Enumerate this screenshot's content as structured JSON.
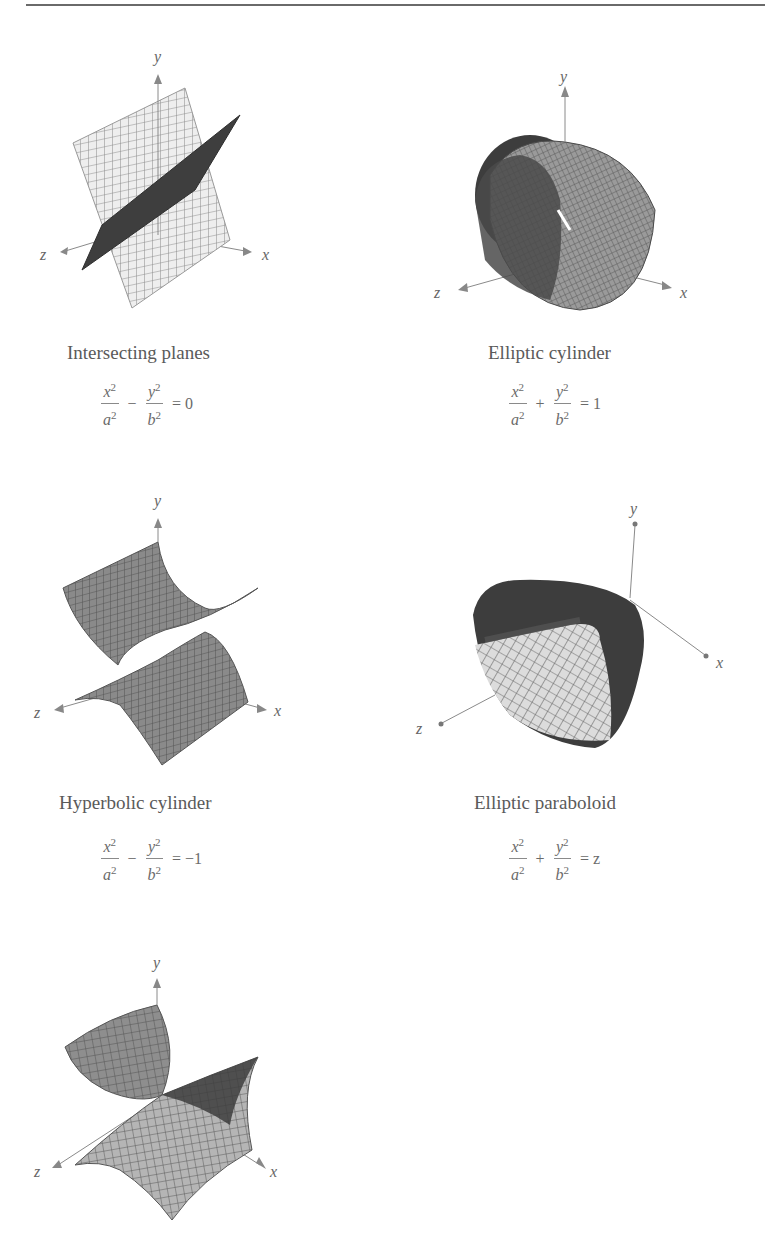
{
  "page": {
    "figures": [
      {
        "id": "intersecting-planes",
        "caption": "Intersecting planes",
        "equation": {
          "term1_num": "x",
          "term1_den": "a",
          "operator": "−",
          "term2_num": "y",
          "term2_den": "b",
          "exp": "2",
          "rhs": "= 0"
        },
        "axes": {
          "x": "x",
          "y": "y",
          "z": "z"
        }
      },
      {
        "id": "elliptic-cylinder",
        "caption": "Elliptic cylinder",
        "equation": {
          "term1_num": "x",
          "term1_den": "a",
          "operator": "+",
          "term2_num": "y",
          "term2_den": "b",
          "exp": "2",
          "rhs": "= 1"
        },
        "axes": {
          "x": "x",
          "y": "y",
          "z": "z"
        }
      },
      {
        "id": "hyperbolic-cylinder",
        "caption": "Hyperbolic cylinder",
        "equation": {
          "term1_num": "x",
          "term1_den": "a",
          "operator": "−",
          "term2_num": "y",
          "term2_den": "b",
          "exp": "2",
          "rhs": "= −1"
        },
        "axes": {
          "x": "x",
          "y": "y",
          "z": "z"
        }
      },
      {
        "id": "elliptic-paraboloid",
        "caption": "Elliptic paraboloid",
        "equation": {
          "term1_num": "x",
          "term1_den": "a",
          "operator": "+",
          "term2_num": "y",
          "term2_den": "b",
          "exp": "2",
          "rhs": "= z"
        },
        "axes": {
          "x": "x",
          "y": "y",
          "z": "z"
        }
      },
      {
        "id": "hyperbolic-paraboloid",
        "axes": {
          "x": "x",
          "y": "y",
          "z": "z"
        }
      }
    ]
  },
  "colors": {
    "surface_dark": "#3a3a3a",
    "surface_mid": "#6e6e6e",
    "surface_light": "#d6d6d6",
    "grid": "#8c8c8c",
    "axis": "#8a8a8a",
    "text": "#5a5a5a"
  }
}
